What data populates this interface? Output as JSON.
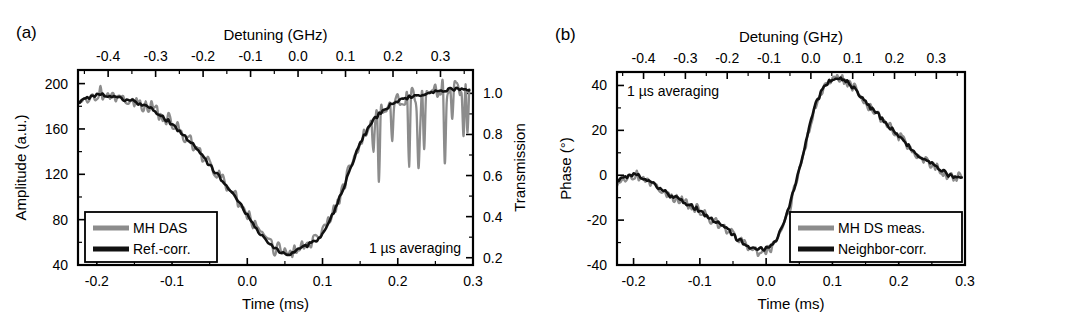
{
  "figure": {
    "background": "#ffffff",
    "width": 1065,
    "height": 332,
    "gray_color": "#8c8c8c",
    "black_color": "#111111"
  },
  "panel_a": {
    "letter": "(a)",
    "annotation": "1 µs averaging",
    "legend": [
      {
        "label": "MH DAS",
        "color": "#8c8c8c"
      },
      {
        "label": "Ref.-corr.",
        "color": "#111111"
      }
    ]
  },
  "panel_b": {
    "letter": "(b)",
    "annotation": "1 µs averaging",
    "legend": [
      {
        "label": "MH DS meas.",
        "color": "#8c8c8c"
      },
      {
        "label": "Neighbor-corr.",
        "color": "#111111"
      }
    ]
  },
  "chart_data": [
    {
      "id": "panel-a",
      "type": "line",
      "title": "",
      "panel_label": "(a)",
      "xlabel": "Time (ms)",
      "ylabel": "Amplitude (a.u.)",
      "x2label": "Detuning (GHz)",
      "y2label": "Transmission",
      "xlim": [
        -0.225,
        0.3
      ],
      "ylim": [
        40,
        212
      ],
      "x2lim": [
        -0.4635,
        0.3685
      ],
      "y2lim": [
        0.1646,
        1.1137
      ],
      "xticks": [
        -0.2,
        -0.1,
        0.0,
        0.1,
        0.2,
        0.3
      ],
      "xticklabels": [
        "-0.2",
        "-0.1",
        "0.0",
        "0.1",
        "0.2",
        "0.3"
      ],
      "xminorticks": [
        -0.15,
        -0.05,
        0.05,
        0.15,
        0.25
      ],
      "yticks": [
        40,
        80,
        120,
        160,
        200
      ],
      "yticklabels": [
        "40",
        "80",
        "120",
        "160",
        "200"
      ],
      "yminorticks": [
        60,
        100,
        140,
        180
      ],
      "x2ticks": [
        -0.4,
        -0.3,
        -0.2,
        -0.1,
        0.0,
        0.1,
        0.2,
        0.3
      ],
      "x2ticklabels": [
        "-0.4",
        "-0.3",
        "-0.2",
        "-0.1",
        "0.0",
        "0.1",
        "0.2",
        "0.3"
      ],
      "x2minorticks": [
        -0.45,
        -0.35,
        -0.25,
        -0.15,
        -0.05,
        0.05,
        0.15,
        0.25,
        0.35
      ],
      "y2ticks": [
        0.2,
        0.4,
        0.6,
        0.8,
        1.0
      ],
      "y2ticklabels": [
        "0.2",
        "0.4",
        "0.6",
        "0.8",
        "1.0"
      ],
      "y2minorticks": [
        0.3,
        0.5,
        0.7,
        0.9
      ],
      "grid": false,
      "legend_position": "lower-left",
      "annotation": "1 µs averaging",
      "series": [
        {
          "name": "MH DAS",
          "color": "#8c8c8c",
          "noise": 6.0,
          "dropout_start": 0.15,
          "dropout_depth": 70,
          "x": [
            -0.225,
            -0.215,
            -0.205,
            -0.195,
            -0.185,
            -0.175,
            -0.165,
            -0.155,
            -0.145,
            -0.135,
            -0.125,
            -0.115,
            -0.105,
            -0.095,
            -0.085,
            -0.075,
            -0.065,
            -0.055,
            -0.045,
            -0.035,
            -0.025,
            -0.015,
            -0.005,
            0.005,
            0.015,
            0.025,
            0.035,
            0.045,
            0.055,
            0.065,
            0.075,
            0.085,
            0.095,
            0.105,
            0.115,
            0.125,
            0.135,
            0.145,
            0.155,
            0.165,
            0.175,
            0.185,
            0.195,
            0.205,
            0.215,
            0.225,
            0.235,
            0.245,
            0.255,
            0.265,
            0.275,
            0.285,
            0.295
          ],
          "values": [
            186,
            189,
            190,
            192,
            191,
            189,
            187,
            186,
            184,
            181,
            178,
            173,
            168,
            162,
            156,
            149,
            141,
            133,
            125,
            117,
            109,
            100,
            90,
            80,
            70,
            62,
            56,
            52,
            51,
            53,
            57,
            60,
            64,
            74,
            88,
            104,
            122,
            140,
            155,
            166,
            174,
            180,
            184,
            187,
            189,
            191,
            192,
            193,
            194,
            195,
            196,
            196,
            195
          ]
        },
        {
          "name": "Ref.-corr.",
          "color": "#111111",
          "noise": 1.6,
          "x": [
            -0.225,
            -0.215,
            -0.205,
            -0.195,
            -0.185,
            -0.175,
            -0.165,
            -0.155,
            -0.145,
            -0.135,
            -0.125,
            -0.115,
            -0.105,
            -0.095,
            -0.085,
            -0.075,
            -0.065,
            -0.055,
            -0.045,
            -0.035,
            -0.025,
            -0.015,
            -0.005,
            0.005,
            0.015,
            0.025,
            0.035,
            0.045,
            0.055,
            0.065,
            0.075,
            0.085,
            0.095,
            0.105,
            0.115,
            0.125,
            0.135,
            0.145,
            0.155,
            0.165,
            0.175,
            0.185,
            0.195,
            0.205,
            0.215,
            0.225,
            0.235,
            0.245,
            0.255,
            0.265,
            0.275,
            0.285,
            0.295
          ],
          "values": [
            184,
            187,
            189,
            190,
            190,
            188,
            186,
            185,
            183,
            180,
            177,
            172,
            167,
            161,
            155,
            148,
            140,
            132,
            124,
            116,
            108,
            99,
            89,
            79,
            69,
            61,
            55,
            51,
            50,
            52,
            56,
            59,
            63,
            73,
            87,
            103,
            121,
            139,
            154,
            165,
            173,
            179,
            183,
            186,
            188,
            190,
            191,
            192,
            193,
            194,
            195,
            195,
            194
          ]
        }
      ]
    },
    {
      "id": "panel-b",
      "type": "line",
      "title": "",
      "panel_label": "(b)",
      "xlabel": "Time (ms)",
      "ylabel": "Phase (°)",
      "x2label": "Detuning (GHz)",
      "xlim": [
        -0.225,
        0.3
      ],
      "ylim": [
        -40,
        46
      ],
      "x2lim": [
        -0.4635,
        0.3685
      ],
      "xticks": [
        -0.2,
        -0.1,
        0.0,
        0.1,
        0.2,
        0.3
      ],
      "xticklabels": [
        "-0.2",
        "-0.1",
        "0.0",
        "0.1",
        "0.2",
        "0.3"
      ],
      "xminorticks": [
        -0.15,
        -0.05,
        0.05,
        0.15,
        0.25
      ],
      "yticks": [
        -40,
        -20,
        0,
        20,
        40
      ],
      "yticklabels": [
        "-40",
        "-20",
        "0",
        "20",
        "40"
      ],
      "yminorticks": [
        -30,
        -10,
        10,
        30
      ],
      "x2ticks": [
        -0.4,
        -0.3,
        -0.2,
        -0.1,
        0.0,
        0.1,
        0.2,
        0.3
      ],
      "x2ticklabels": [
        "-0.4",
        "-0.3",
        "-0.2",
        "-0.1",
        "0.0",
        "0.1",
        "0.2",
        "0.3"
      ],
      "x2minorticks": [
        -0.45,
        -0.35,
        -0.25,
        -0.15,
        -0.05,
        0.05,
        0.15,
        0.25,
        0.35
      ],
      "grid": false,
      "legend_position": "lower-right",
      "annotation": "1 µs averaging",
      "series": [
        {
          "name": "MH DS meas.",
          "color": "#8c8c8c",
          "noise": 2.1,
          "x": [
            -0.225,
            -0.215,
            -0.205,
            -0.195,
            -0.185,
            -0.175,
            -0.165,
            -0.155,
            -0.145,
            -0.135,
            -0.125,
            -0.115,
            -0.105,
            -0.095,
            -0.085,
            -0.075,
            -0.065,
            -0.055,
            -0.045,
            -0.035,
            -0.025,
            -0.015,
            -0.005,
            0.005,
            0.015,
            0.025,
            0.035,
            0.045,
            0.055,
            0.065,
            0.075,
            0.085,
            0.095,
            0.105,
            0.115,
            0.125,
            0.135,
            0.145,
            0.155,
            0.165,
            0.175,
            0.185,
            0.195,
            0.205,
            0.215,
            0.225,
            0.235,
            0.245,
            0.255,
            0.265,
            0.275,
            0.285,
            0.295
          ],
          "values": [
            -3,
            -1,
            0,
            0,
            -1,
            -3,
            -5,
            -7,
            -9,
            -10,
            -12,
            -13,
            -15,
            -17,
            -19,
            -21,
            -23,
            -25,
            -27,
            -30,
            -32,
            -34,
            -34,
            -33,
            -30,
            -24,
            -15,
            -4,
            8,
            20,
            31,
            38,
            41,
            43,
            43,
            41,
            38,
            34,
            31,
            28,
            25,
            22,
            19,
            16,
            13,
            10,
            8,
            6,
            4,
            2,
            0,
            -1,
            -1
          ]
        },
        {
          "name": "Neighbor-corr.",
          "color": "#111111",
          "noise": 0.9,
          "x": [
            -0.225,
            -0.215,
            -0.205,
            -0.195,
            -0.185,
            -0.175,
            -0.165,
            -0.155,
            -0.145,
            -0.135,
            -0.125,
            -0.115,
            -0.105,
            -0.095,
            -0.085,
            -0.075,
            -0.065,
            -0.055,
            -0.045,
            -0.035,
            -0.025,
            -0.015,
            -0.005,
            0.005,
            0.015,
            0.025,
            0.035,
            0.045,
            0.055,
            0.065,
            0.075,
            0.085,
            0.095,
            0.105,
            0.115,
            0.125,
            0.135,
            0.145,
            0.155,
            0.165,
            0.175,
            0.185,
            0.195,
            0.205,
            0.215,
            0.225,
            0.235,
            0.245,
            0.255,
            0.265,
            0.275,
            0.285,
            0.295
          ],
          "values": [
            -2,
            -1,
            0,
            0,
            -1,
            -3,
            -5,
            -7,
            -9,
            -10,
            -12,
            -13,
            -15,
            -17,
            -19,
            -21,
            -23,
            -25,
            -28,
            -30,
            -32,
            -33,
            -33,
            -32,
            -29,
            -23,
            -14,
            -3,
            9,
            21,
            32,
            38,
            42,
            43,
            43,
            41,
            38,
            34,
            31,
            28,
            25,
            22,
            19,
            16,
            13,
            10,
            8,
            6,
            4,
            2,
            0,
            -1,
            -1
          ]
        }
      ]
    }
  ]
}
